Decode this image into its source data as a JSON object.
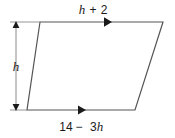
{
  "figure": {
    "type": "geometry-diagram",
    "shape_name": "parallelogram",
    "background_color": "#ffffff",
    "stroke_color": "#555555",
    "text_color": "#1a1a1a",
    "labels": {
      "top_side": {
        "text": "h + 2",
        "variable": "h",
        "operator": "+",
        "constant": "2"
      },
      "bottom_side": {
        "text": "14 − 3h",
        "constant": "14",
        "operator": "−",
        "term": "3h"
      },
      "left_height": {
        "text": "h"
      }
    },
    "marks": {
      "top_arrow": "single-chevron-right",
      "bottom_arrow": "single-chevron-right",
      "height_arrow": "double-headed-vertical"
    },
    "geometry": {
      "top_left": [
        40,
        22
      ],
      "top_right": [
        163,
        22
      ],
      "bottom_right": [
        135,
        110
      ],
      "bottom_left": [
        27,
        110
      ]
    }
  }
}
